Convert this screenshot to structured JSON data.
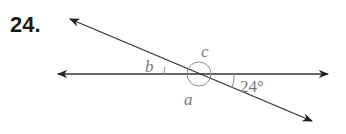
{
  "problem": {
    "number": "24."
  },
  "diagram": {
    "labels": {
      "b": "b",
      "c": "c",
      "a": "a",
      "given_angle": "24°"
    },
    "colors": {
      "line": "#333333",
      "arc": "#8a8a8a",
      "label": "#7a7a7a"
    }
  }
}
